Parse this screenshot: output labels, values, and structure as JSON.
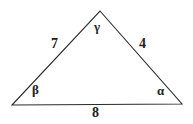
{
  "figure": {
    "type": "triangle-diagram",
    "stroke_color": "#2b2b2b",
    "background_color": "#ffffff",
    "stroke_width": 1.1,
    "vertices": {
      "apex": {
        "name": "gamma-vertex",
        "x": 100,
        "y": 11
      },
      "left": {
        "name": "beta-vertex",
        "x": 12,
        "y": 105
      },
      "right": {
        "name": "alpha-vertex",
        "x": 182,
        "y": 104
      }
    },
    "sides": [
      {
        "id": "left-side",
        "label": "7",
        "between": "beta-vertex to gamma-vertex"
      },
      {
        "id": "right-side",
        "label": "4",
        "between": "gamma-vertex to alpha-vertex"
      },
      {
        "id": "base-side",
        "label": "8",
        "between": "beta-vertex to alpha-vertex"
      }
    ],
    "angles": [
      {
        "id": "gamma-angle",
        "label": "γ",
        "at": "apex"
      },
      {
        "id": "beta-angle",
        "label": "β",
        "at": "left"
      },
      {
        "id": "alpha-angle",
        "label": "α",
        "at": "right"
      }
    ]
  }
}
